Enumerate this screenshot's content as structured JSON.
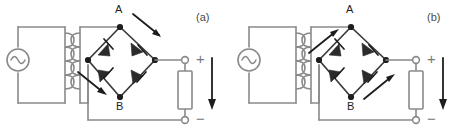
{
  "figure": {
    "caption_a": "(a)",
    "caption_b": "(b)"
  },
  "panels": [
    {
      "id": "a",
      "label": "(a)",
      "node_top_label": "A",
      "node_bottom_label": "B",
      "output_plus": "+",
      "output_minus": "−",
      "source_symbol": "~",
      "current_arrows": [
        {
          "name": "upper-right-current-arrow",
          "direction": "down-right"
        },
        {
          "name": "lower-left-current-arrow",
          "direction": "down-right"
        },
        {
          "name": "load-current-arrow",
          "direction": "down"
        }
      ],
      "components": {
        "ac_source": "ac-voltage-source",
        "transformer": "transformer",
        "diodes": [
          "diode-top-left",
          "diode-top-right",
          "diode-bottom-left",
          "diode-bottom-right"
        ],
        "load": "load-resistor"
      }
    },
    {
      "id": "b",
      "label": "(b)",
      "node_top_label": "A",
      "node_bottom_label": "B",
      "output_plus": "+",
      "output_minus": "−",
      "source_symbol": "~",
      "current_arrows": [
        {
          "name": "upper-left-current-arrow",
          "direction": "up-right"
        },
        {
          "name": "lower-right-current-arrow",
          "direction": "up-right"
        },
        {
          "name": "load-current-arrow",
          "direction": "down"
        }
      ],
      "components": {
        "ac_source": "ac-voltage-source",
        "transformer": "transformer",
        "diodes": [
          "diode-top-left",
          "diode-top-right",
          "diode-bottom-left",
          "diode-bottom-right"
        ],
        "load": "load-resistor"
      }
    }
  ],
  "colors": {
    "wire": "#8a8a8a",
    "node": "#1d1d1d",
    "arrow": "#1d1d1d",
    "text": "#2b2b2b",
    "sign": "#7a7a7a",
    "background": "#ffffff"
  }
}
